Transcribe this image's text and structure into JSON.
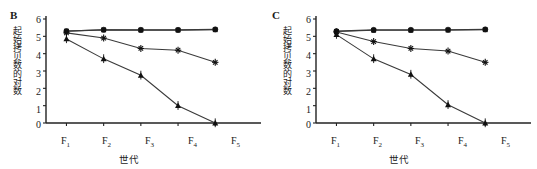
{
  "figure": {
    "panels": [
      {
        "label": "B",
        "ylabel": "起始拷贝数的对数",
        "xlabel": "世代",
        "ytick_labels": [
          "0",
          "1",
          "2",
          "3",
          "4",
          "5",
          "6"
        ],
        "xtick_labels": [
          "F",
          "F",
          "F",
          "F",
          "F"
        ],
        "xtick_subscripts": [
          "1",
          "2",
          "3",
          "4",
          "5"
        ]
      },
      {
        "label": "C",
        "ylabel": "起始拷贝数的对数",
        "xlabel": "世代",
        "ytick_labels": [
          "0",
          "1",
          "2",
          "3",
          "4",
          "5",
          "6"
        ],
        "xtick_labels": [
          "F",
          "F",
          "F",
          "F",
          "F"
        ],
        "xtick_subscripts": [
          "1",
          "2",
          "3",
          "4",
          "5"
        ]
      }
    ],
    "axis_color": "#222222",
    "line_color": "#3a3a3a"
  },
  "chart_data": [
    {
      "type": "line",
      "title": "B",
      "xlabel": "世代",
      "ylabel": "起始拷贝数的对数",
      "categories": [
        "F1",
        "F2",
        "F3",
        "F4",
        "F5"
      ],
      "ylim": [
        0,
        6
      ],
      "yticks": [
        0,
        1,
        2,
        3,
        4,
        5,
        6
      ],
      "grid": false,
      "legend": "none",
      "series": [
        {
          "name": "circle-series",
          "marker": "circle",
          "values": [
            5.3,
            5.38,
            5.37,
            5.37,
            5.4
          ]
        },
        {
          "name": "square-series",
          "marker": "square",
          "values": [
            5.3,
            5.37,
            5.36,
            5.36,
            5.38
          ]
        },
        {
          "name": "asterisk-series",
          "marker": "asterisk",
          "values": [
            5.2,
            4.9,
            4.3,
            4.2,
            3.5
          ]
        },
        {
          "name": "triangle-series",
          "marker": "triangle",
          "values": [
            4.85,
            3.7,
            2.75,
            1.0,
            0.0
          ]
        }
      ]
    },
    {
      "type": "line",
      "title": "C",
      "xlabel": "世代",
      "ylabel": "起始拷贝数的对数",
      "categories": [
        "F1",
        "F2",
        "F3",
        "F4",
        "F5"
      ],
      "ylim": [
        0,
        6
      ],
      "yticks": [
        0,
        1,
        2,
        3,
        4,
        5,
        6
      ],
      "grid": false,
      "legend": "none",
      "series": [
        {
          "name": "circle-series",
          "marker": "circle",
          "values": [
            5.3,
            5.37,
            5.37,
            5.38,
            5.4
          ]
        },
        {
          "name": "square-series",
          "marker": "square",
          "values": [
            5.28,
            5.35,
            5.35,
            5.36,
            5.38
          ]
        },
        {
          "name": "asterisk-series",
          "marker": "asterisk",
          "values": [
            5.25,
            4.7,
            4.3,
            4.15,
            3.5
          ]
        },
        {
          "name": "triangle-series",
          "marker": "triangle",
          "values": [
            5.1,
            3.7,
            2.8,
            1.05,
            0.0
          ]
        }
      ]
    }
  ]
}
